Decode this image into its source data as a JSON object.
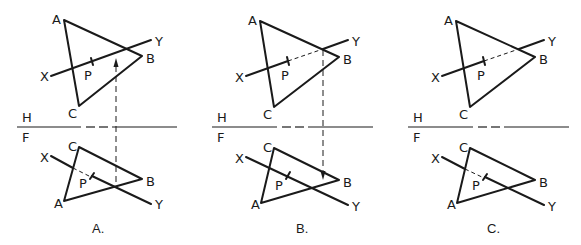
{
  "figure": {
    "panels": [
      {
        "caption": "A.",
        "fold_labels": {
          "top": "H",
          "bottom": "F"
        },
        "top_view": {
          "vertices": {
            "A": "A",
            "B": "B",
            "C": "C"
          },
          "line_ends": {
            "X": "X",
            "Y": "Y"
          },
          "point": "P"
        },
        "front_view": {
          "vertices": {
            "A": "A",
            "B": "B",
            "C": "C"
          },
          "line_ends": {
            "X": "X",
            "Y": "Y"
          },
          "point": "P"
        },
        "projector": "upward arrow from front view intersection to top view"
      },
      {
        "caption": "B.",
        "fold_labels": {
          "top": "H",
          "bottom": "F"
        },
        "top_view": {
          "vertices": {
            "A": "A",
            "B": "B",
            "C": "C"
          },
          "line_ends": {
            "X": "X",
            "Y": "Y"
          },
          "point": "P"
        },
        "front_view": {
          "vertices": {
            "A": "A",
            "B": "B",
            "C": "C"
          },
          "line_ends": {
            "X": "X",
            "Y": "Y"
          },
          "point": "P"
        },
        "projector": "downward arrow from top view intersection to front view"
      },
      {
        "caption": "C.",
        "fold_labels": {
          "top": "H",
          "bottom": "F"
        },
        "top_view": {
          "vertices": {
            "A": "A",
            "B": "B",
            "C": "C"
          },
          "line_ends": {
            "X": "X",
            "Y": "Y"
          },
          "point": "P"
        },
        "front_view": {
          "vertices": {
            "A": "A",
            "B": "B",
            "C": "C"
          },
          "line_ends": {
            "X": "X",
            "Y": "Y"
          },
          "point": "P"
        },
        "projector": "none"
      }
    ],
    "colors": {
      "ink": "#1a1a1a",
      "background": "#ffffff"
    }
  }
}
